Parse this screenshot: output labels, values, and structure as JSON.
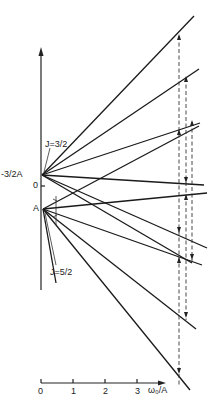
{
  "diagram": {
    "type": "energy-level splitting diagram",
    "y_axis": {
      "labels": {
        "upper_level": "-3/2A",
        "zero": "0",
        "lower_level": "A"
      }
    },
    "x_axis": {
      "ticks": [
        "0",
        "1",
        "2",
        "3"
      ],
      "label": "ω₀/A"
    },
    "annotations": {
      "upper_group": "J=3/2",
      "lower_group": "J=5/2"
    },
    "groups": [
      {
        "name": "J=3/2",
        "origin_level": "-3/2A",
        "line_count": 6
      },
      {
        "name": "J=5/2",
        "origin_level": "A",
        "line_count": 6
      }
    ],
    "transitions": {
      "style": "dashed vertical arrows",
      "count": 3
    },
    "colors": {
      "ink": "#1a1a1a",
      "background": "#ffffff"
    }
  }
}
